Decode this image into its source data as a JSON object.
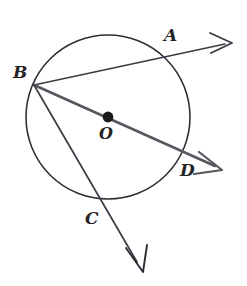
{
  "figure": {
    "type": "circle-geometry-diagram",
    "background_color": "#ffffff",
    "stroke_color": "#3c3c46",
    "label_color": "#242424",
    "width": 247,
    "height": 286
  },
  "circle": {
    "label": "circle O",
    "center_x": 108,
    "center_y": 117,
    "radius": 82,
    "stroke_width": 1.6
  },
  "center_point": {
    "label": "O",
    "x": 108,
    "y": 117,
    "dot_radius": 5
  },
  "points": [
    {
      "id": "A",
      "label": "A",
      "x": 166,
      "y": 54,
      "label_x": 164,
      "label_y": 27,
      "on_circle": true
    },
    {
      "id": "B",
      "label": "B",
      "x": 34,
      "y": 85,
      "label_x": 13,
      "label_y": 64,
      "on_circle": true
    },
    {
      "id": "C",
      "label": "C",
      "x": 104,
      "y": 199,
      "label_x": 85,
      "label_y": 210,
      "on_circle": true
    },
    {
      "id": "D",
      "label": "D",
      "x": 184,
      "y": 155,
      "label_x": 180,
      "label_y": 162,
      "on_circle": true
    },
    {
      "id": "O",
      "label": "O",
      "x": 108,
      "y": 117,
      "label_x": 99,
      "label_y": 126,
      "on_circle": false
    }
  ],
  "rays": [
    {
      "id": "BA",
      "label": "ray BA",
      "from": "B",
      "through": "A",
      "start_x": 34,
      "start_y": 85,
      "end_x": 231,
      "end_y": 43,
      "stroke_width": 1.7,
      "arrowhead": true
    },
    {
      "id": "BD",
      "label": "ray BD through O",
      "from": "B",
      "through": "O and D",
      "start_x": 34,
      "start_y": 85,
      "end_x": 221,
      "end_y": 169,
      "stroke_width": 2.4,
      "arrowhead": true
    },
    {
      "id": "BC",
      "label": "ray BC",
      "from": "B",
      "through": "C",
      "start_x": 34,
      "start_y": 85,
      "end_x": 142,
      "end_y": 270,
      "stroke_width": 1.7,
      "arrowhead": true
    }
  ]
}
